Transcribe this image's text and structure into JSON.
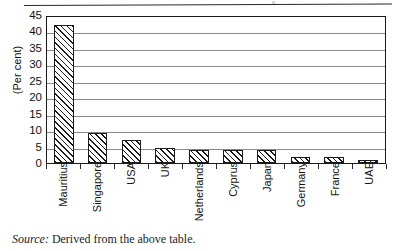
{
  "page": {
    "source_note_label": "Source:",
    "source_note_text": "Derived from the above table.",
    "top_rule_mark": "o"
  },
  "chart_data": {
    "type": "bar",
    "title": "",
    "subtitle": "",
    "xlabel": "",
    "ylabel": "(Per cent)",
    "ylim": [
      0,
      45
    ],
    "ytick_step": 5,
    "grid": true,
    "legend": "none",
    "orientation": "vertical",
    "bar_fill": "diagonal-hatch",
    "categories": [
      "Mauritius",
      "Singapore",
      "USA",
      "UK",
      "Netherlands",
      "Cyprus",
      "Japan",
      "Germany",
      "France",
      "UAE"
    ],
    "values": [
      42,
      9,
      7,
      4.5,
      4,
      4,
      4,
      1.8,
      1.8,
      0.8
    ],
    "ytick_labels": [
      "45",
      "40",
      "35",
      "30",
      "25",
      "20",
      "15",
      "10",
      "5",
      "0"
    ],
    "ytick_values": [
      45,
      40,
      35,
      30,
      25,
      20,
      15,
      10,
      5,
      0
    ]
  },
  "colors": {
    "axis": "#1a1a1a",
    "gridline": "#8a8a8a",
    "bar_stroke": "#1b1b1b",
    "bar_fill": "#ffffff",
    "text": "#141414",
    "background": "#ffffff"
  }
}
